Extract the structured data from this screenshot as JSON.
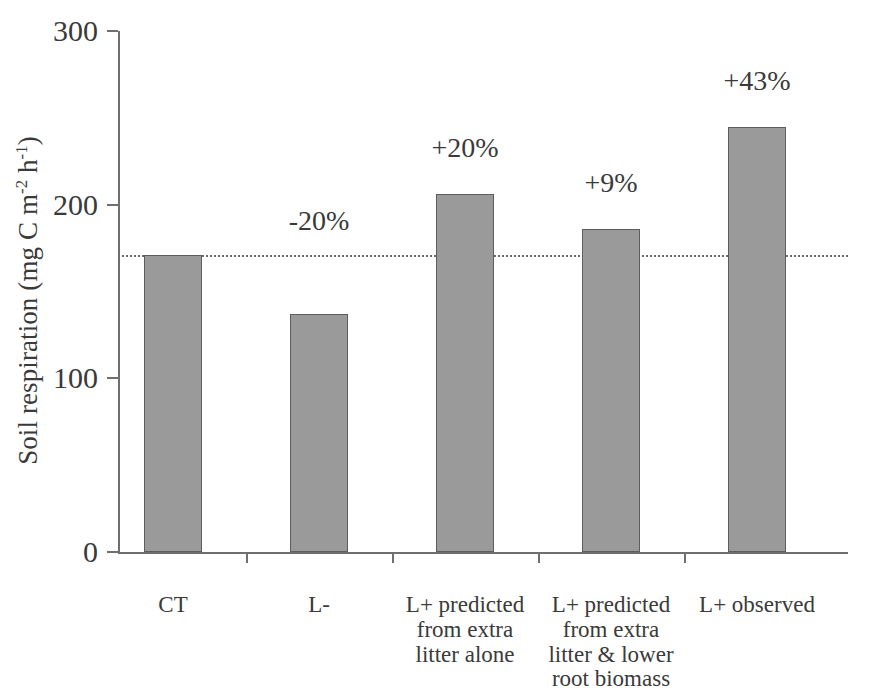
{
  "chart_data": {
    "type": "bar",
    "title": "",
    "xlabel": "",
    "ylabel": "Soil respiration (mg C m-2 h-1)",
    "ylabel_parts": {
      "pre": "Soil respiration (mg C m",
      "sup1": "-2",
      "mid": " h",
      "sup2": "-1",
      "post": ")"
    },
    "categories": [
      "CT",
      "L-",
      "L+ predicted from extra litter alone",
      "L+ predicted from extra litter & lower root biomass",
      "L+ observed"
    ],
    "category_lines": [
      [
        "CT"
      ],
      [
        "L-"
      ],
      [
        "L+ predicted",
        "from extra",
        "litter alone"
      ],
      [
        "L+ predicted",
        "from extra",
        "litter & lower",
        "root biomass"
      ],
      [
        "L+ observed"
      ]
    ],
    "values": [
      171,
      137,
      206,
      186,
      245
    ],
    "annotations": [
      "",
      "-20%",
      "+20%",
      "+9%",
      "+43%"
    ],
    "ylim": [
      0,
      300
    ],
    "yticks": [
      0,
      100,
      200,
      300
    ],
    "ytick_labels": [
      "0",
      "100",
      "200",
      "300"
    ],
    "grid": false,
    "legend": false,
    "reference_line": {
      "value": 171,
      "style": "dotted",
      "label": ""
    },
    "series": [
      {
        "name": "Soil respiration",
        "values": [
          171,
          137,
          206,
          186,
          245
        ]
      }
    ],
    "colors": {
      "bar_fill": "#9a9a9a",
      "bar_edge": "#5e5e5e",
      "axis": "#6f6f6f",
      "text": "#3a3a3a",
      "reference_line": "#6b6b6b",
      "background": "#ffffff"
    }
  },
  "caption_sliver": ""
}
